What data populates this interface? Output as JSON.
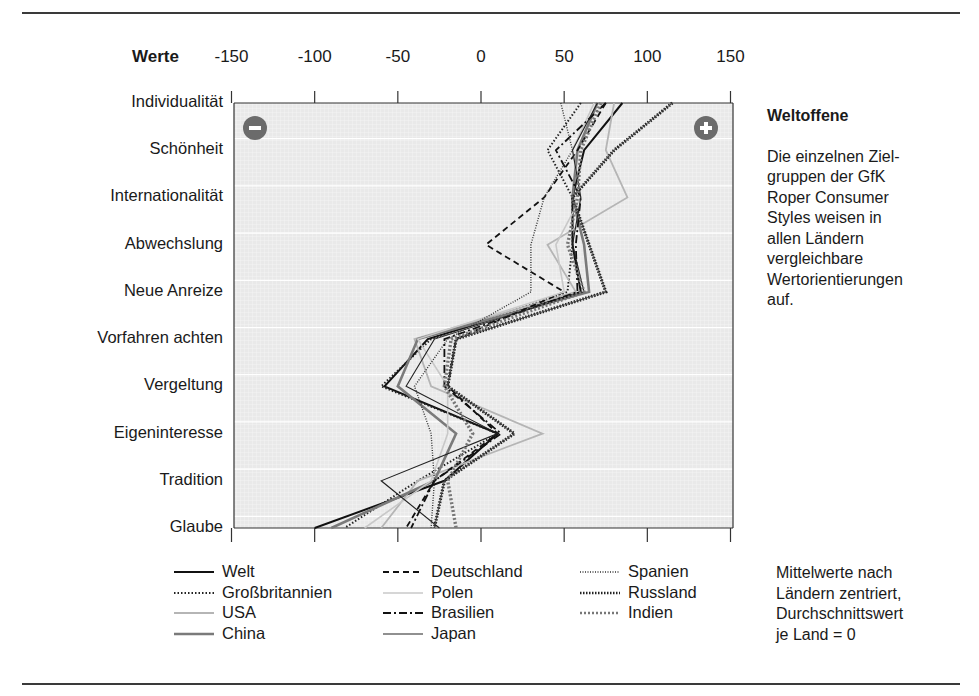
{
  "chart_data": {
    "type": "line",
    "orientation": "horizontal-profile",
    "title": "Weltoffene",
    "axis_title": "Werte",
    "xlabel": "Werte",
    "ylabel": "",
    "xlim": [
      -150,
      150
    ],
    "x_ticks": [
      "-150",
      "-100",
      "-50",
      "0",
      "50",
      "100",
      "150"
    ],
    "categories": [
      "Individualität",
      "Schönheit",
      "Internationalität",
      "Abwechslung",
      "Neue Anreize",
      "Vorfahren achten",
      "Vergeltung",
      "Eigeninteresse",
      "Tradition",
      "Glaube"
    ],
    "grid": true,
    "legend_position": "bottom",
    "series": [
      {
        "name": "Welt",
        "style": "solid-black",
        "values": [
          85,
          62,
          55,
          55,
          60,
          -32,
          -58,
          10,
          -22,
          -100
        ]
      },
      {
        "name": "Großbritannien",
        "style": "dotted-black",
        "values": [
          60,
          40,
          55,
          55,
          52,
          -30,
          -60,
          10,
          -38,
          -82
        ]
      },
      {
        "name": "USA",
        "style": "solid-lightgray",
        "values": [
          80,
          75,
          88,
          40,
          57,
          -40,
          -30,
          37,
          -38,
          -60
        ]
      },
      {
        "name": "China",
        "style": "solid-gray",
        "values": [
          70,
          58,
          55,
          62,
          65,
          -38,
          -50,
          -15,
          -28,
          -90
        ]
      },
      {
        "name": "Deutschland",
        "style": "dashed-black",
        "values": [
          75,
          58,
          38,
          3,
          50,
          -15,
          -20,
          10,
          -28,
          -45
        ]
      },
      {
        "name": "Polen",
        "style": "solid-silver",
        "values": [
          68,
          55,
          60,
          45,
          50,
          -38,
          -20,
          -20,
          -30,
          -70
        ]
      },
      {
        "name": "Brasilien",
        "style": "dashdot-black",
        "values": [
          75,
          45,
          60,
          57,
          58,
          -22,
          -22,
          12,
          -28,
          -42
        ]
      },
      {
        "name": "Japan",
        "style": "solid-thin-black",
        "values": [
          70,
          55,
          60,
          55,
          62,
          -28,
          -45,
          10,
          -60,
          -25
        ]
      },
      {
        "name": "Spanien",
        "style": "dotted-fine-black",
        "values": [
          48,
          55,
          38,
          30,
          30,
          -20,
          -40,
          -30,
          -28,
          -30
        ]
      },
      {
        "name": "Russland",
        "style": "starred-black",
        "values": [
          115,
          80,
          55,
          65,
          75,
          -15,
          -20,
          20,
          -22,
          -28
        ]
      },
      {
        "name": "Indien",
        "style": "dotted-thick-gray",
        "values": [
          72,
          60,
          58,
          52,
          62,
          -18,
          -22,
          -5,
          -20,
          -15
        ]
      }
    ],
    "annotations": [
      "−",
      "+"
    ]
  },
  "sidebar": {
    "title": "Weltoffene",
    "lines": [
      "Die einzelnen Ziel-",
      "gruppen der GfK",
      "Roper Consumer",
      "Styles weisen in",
      "allen Ländern",
      "vergleichbare",
      "Wertorientierungen",
      "auf."
    ]
  },
  "legend": {
    "items": [
      "Welt",
      "Großbritannien",
      "USA",
      "China",
      "Deutschland",
      "Polen",
      "Brasilien",
      "Japan",
      "Spanien",
      "Russland",
      "Indien"
    ]
  },
  "note": {
    "lines": [
      "Mittelwerte nach",
      "Ländern zentriert,",
      "Durchschnittswert",
      "je Land = 0"
    ]
  },
  "markers": {
    "minus": "−",
    "plus": "+"
  },
  "colors": {
    "plot_bg": "#ececec",
    "grid": "#ffffff",
    "axis": "#333333",
    "marker": "#6b6b6b"
  }
}
